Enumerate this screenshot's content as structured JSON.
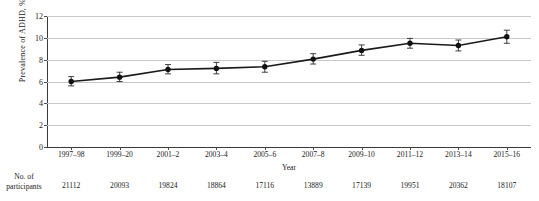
{
  "chart_data": {
    "type": "line",
    "title": "",
    "xlabel": "Year",
    "ylabel": "Prevalence of ADHD, %",
    "ylim": [
      0,
      12
    ],
    "yticks": [
      0,
      2,
      4,
      6,
      8,
      10,
      12
    ],
    "ytick_labels": [
      "0",
      "2",
      "4",
      "6",
      "8",
      "10",
      "12"
    ],
    "grid": true,
    "legend": "none",
    "categories": [
      "1997–98",
      "1999–20",
      "2001–2",
      "2003–4",
      "2005–6",
      "2007–8",
      "2009–10",
      "2011–12",
      "2013–14",
      "2015–16"
    ],
    "series": [
      {
        "name": "Prevalence of ADHD",
        "values": [
          6.0,
          6.4,
          7.1,
          7.2,
          7.35,
          8.05,
          8.85,
          9.5,
          9.3,
          10.1
        ],
        "error_low": [
          5.6,
          6.0,
          6.7,
          6.7,
          6.85,
          7.6,
          8.4,
          9.05,
          8.8,
          9.5
        ],
        "error_high": [
          6.45,
          6.85,
          7.55,
          7.75,
          7.85,
          8.55,
          9.35,
          9.95,
          9.8,
          10.7
        ],
        "color": "#1a1a1a",
        "marker": "circle"
      }
    ],
    "annotation_row": {
      "label_line1": "No. of",
      "label_line2": "participants",
      "values": [
        "21112",
        "20093",
        "19824",
        "18864",
        "17116",
        "13889",
        "17139",
        "19951",
        "20362",
        "18107"
      ]
    },
    "colors": {
      "line": "#1a1a1a",
      "marker": "#111111",
      "grid": "#c8c8c8",
      "axis": "#3a3a3a",
      "error_bar": "#2a2a2a",
      "background": "#ffffff"
    }
  }
}
